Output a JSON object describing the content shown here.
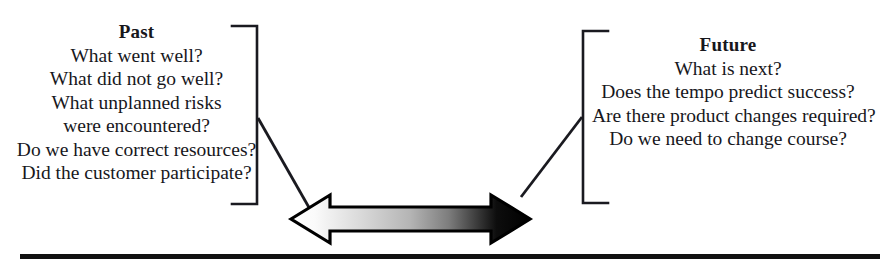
{
  "diagram": {
    "background_color": "#ffffff",
    "ink_color": "#17171c",
    "past": {
      "heading": "Past",
      "questions": [
        "What went well?",
        "What did not go well?",
        "What unplanned risks",
        "were encountered?",
        "Do we have correct resources?",
        "Did the customer participate?"
      ]
    },
    "future": {
      "heading": "Future",
      "questions": [
        "What is next?",
        "Does the tempo predict success?",
        "Are there product changes required?",
        "Do we need to change course?"
      ]
    },
    "arrow": {
      "name": "double-headed-gradient-arrow",
      "direction": "bidirectional",
      "gradient_start_color": "#ffffff",
      "gradient_end_color": "#000000",
      "outline_color": "#000000"
    },
    "brackets": {
      "left_label": "past-bracket",
      "right_label": "future-bracket",
      "stroke_color": "#1a1a20"
    },
    "rule": {
      "label": "bottom-rule",
      "color": "#111111"
    }
  }
}
